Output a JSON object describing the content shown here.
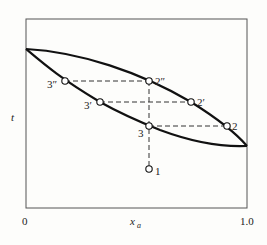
{
  "diagram": {
    "type": "phase-diagram",
    "y_axis_label": "t",
    "x_axis_label": "x",
    "x_axis_subscript": "a",
    "x_ticks": [
      "0",
      "1.0"
    ],
    "points": [
      {
        "id": "1",
        "label": "1"
      },
      {
        "id": "2",
        "label": "2"
      },
      {
        "id": "2p",
        "label": "2′"
      },
      {
        "id": "2pp",
        "label": "2″"
      },
      {
        "id": "3",
        "label": "3"
      },
      {
        "id": "3p",
        "label": "3′"
      },
      {
        "id": "3pp",
        "label": "3″"
      }
    ],
    "colors": {
      "line": "#111111",
      "background": "#fdfdfb"
    }
  }
}
